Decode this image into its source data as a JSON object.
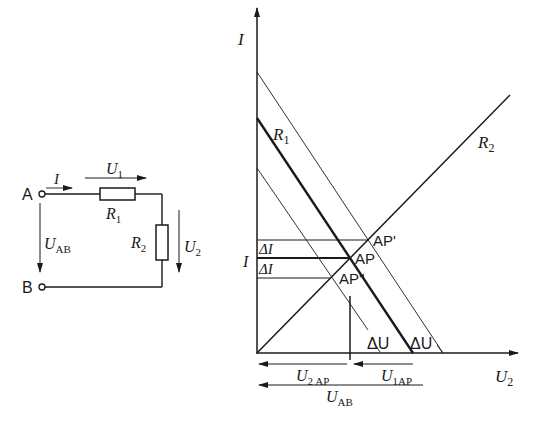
{
  "circuit": {
    "terminal_a": "A",
    "terminal_b": "B",
    "current": "I",
    "u1": {
      "main": "U",
      "sub": "1"
    },
    "r1": {
      "main": "R",
      "sub": "1"
    },
    "r2": {
      "main": "R",
      "sub": "2"
    },
    "u2": {
      "main": "U",
      "sub": "2"
    },
    "uab": {
      "main": "U",
      "sub": "AB"
    }
  },
  "graph": {
    "y_axis_label": "I",
    "x_axis_label": {
      "main": "U",
      "sub": "2"
    },
    "r1_label": {
      "main": "R",
      "sub": "1"
    },
    "r2_label": {
      "main": "R",
      "sub": "2"
    },
    "current_label": "I",
    "delta_i_upper": "ΔI",
    "delta_i_lower": "ΔI",
    "ap": "AP",
    "ap_prime": "AP'",
    "ap_double_prime": "AP''",
    "delta_u_left": "ΔU",
    "delta_u_right": "ΔU",
    "u2ap": {
      "main": "U",
      "sub": "2 AP"
    },
    "u1ap": {
      "main": "U",
      "sub": "1AP"
    },
    "uab": {
      "main": "U",
      "sub": "AB"
    }
  },
  "colors": {
    "ink": "#1a1a1a",
    "background": "#ffffff"
  }
}
